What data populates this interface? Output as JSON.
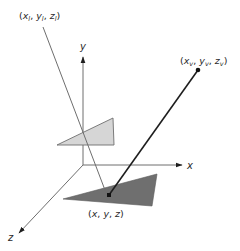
{
  "diagram": {
    "title": "",
    "colors": {
      "axis": "#6e6e6e",
      "light_triangle_fill": "#d6d6d6",
      "light_triangle_stroke": "#6e6e6e",
      "dark_triangle_fill": "#6f6f6f",
      "dark_triangle_stroke": "#5a5a5a",
      "light_ray": "#6e6e6e",
      "view_ray": "#1e1e1e",
      "point": "#111111",
      "text": "#2a2a2a"
    },
    "axes": {
      "origin": [
        83,
        165
      ],
      "x": {
        "label": "x",
        "end": [
          183,
          165
        ]
      },
      "y": {
        "label": "y",
        "end": [
          83,
          56
        ]
      },
      "z": {
        "label": "z",
        "end": [
          18,
          234
        ]
      }
    },
    "labels": {
      "light_source": "(x_l, y_l, z_l)",
      "light_source_parts": {
        "x": "x",
        "x_sub": "l",
        "y": "y",
        "y_sub": "l",
        "z": "z",
        "z_sub": "l"
      },
      "viewer": "(x_v, y_v, z_v)",
      "viewer_parts": {
        "x": "x",
        "x_sub": "v",
        "y": "y",
        "y_sub": "v",
        "z": "z",
        "z_sub": "v"
      },
      "surface_point": "(x, y, z)",
      "surface_point_parts": {
        "x": "x",
        "y": "y",
        "z": "z"
      }
    },
    "shapes": {
      "light_triangle": [
        [
          57,
          145
        ],
        [
          113,
          118
        ],
        [
          114,
          145
        ]
      ],
      "dark_triangle": [
        [
          63,
          199
        ],
        [
          157,
          174
        ],
        [
          152,
          206
        ]
      ],
      "light_ray": {
        "from": [
          43,
          26
        ],
        "to": [
          108,
          200
        ]
      },
      "view_ray": {
        "from": [
          198,
          70
        ],
        "to": [
          109,
          195
        ]
      },
      "viewer_point": [
        198,
        70
      ],
      "surface_point": [
        109,
        195
      ]
    }
  }
}
